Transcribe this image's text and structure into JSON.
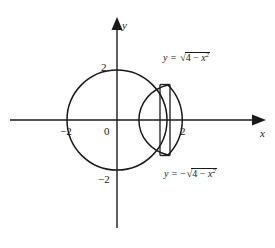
{
  "figure": {
    "kind": "math-diagram",
    "background_color": "#ffffff",
    "stroke_color": "#1a1a1a",
    "axes": {
      "x_axis_label": "x",
      "y_axis_label": "y",
      "origin_label": "0",
      "x_ticks": [
        {
          "label": "−2",
          "value": -2
        },
        {
          "label": "2",
          "value": 2
        }
      ],
      "y_ticks": [
        {
          "label": "2",
          "value": 2
        },
        {
          "label": "−2",
          "value": -2
        }
      ]
    },
    "curves": [
      {
        "name": "upper-semicircle",
        "equation_prefix": "y = ",
        "sign": "",
        "radicand_lead": "4 − ",
        "radicand_var": "x",
        "radicand_exp": "2",
        "equation_plain": "y = √(4 − x²)"
      },
      {
        "name": "lower-semicircle",
        "equation_prefix": "y = ",
        "sign": "−",
        "radicand_lead": "4 − ",
        "radicand_var": "x",
        "radicand_exp": "2",
        "equation_plain": "y = −√(4 − x²)"
      }
    ],
    "geometry": {
      "circle_radius_units": 2,
      "circle_center": [
        0,
        0
      ],
      "lens_left_x_units": 0.8,
      "chord_count": 2
    }
  }
}
